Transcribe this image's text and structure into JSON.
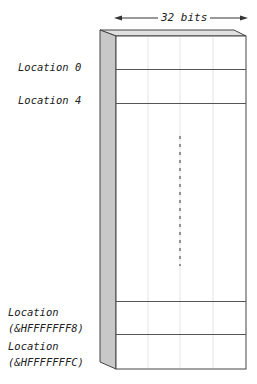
{
  "diagram": {
    "width_label": "32 bits",
    "labels": [
      {
        "id": "loc0",
        "lines": [
          "Location 0"
        ]
      },
      {
        "id": "loc4",
        "lines": [
          "Location 4"
        ]
      },
      {
        "id": "locF8",
        "lines": [
          "Location",
          "(&HFFFFFFF8)"
        ]
      },
      {
        "id": "locFC",
        "lines": [
          "Location",
          "(&HFFFFFFFC)"
        ]
      }
    ],
    "colors": {
      "side_face": "#c8c8c8",
      "top_face": "#e0e0e0",
      "outline": "#444444",
      "grid_light": "#e4e4e4",
      "row_line": "#555555"
    },
    "continuation": "vertical-dashed-ellipsis"
  }
}
